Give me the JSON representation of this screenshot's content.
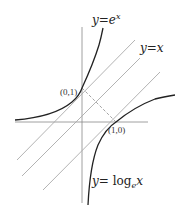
{
  "diagram": {
    "labels": {
      "exp_curve": {
        "prefix": "y",
        "eq": "=",
        "base": "e",
        "sup": "x"
      },
      "identity_line": {
        "prefix": "y",
        "eq": "=",
        "var": "x"
      },
      "log_curve": {
        "prefix": "y",
        "eq": "= ",
        "fn": "log",
        "sub": "e",
        "var": "x"
      }
    },
    "points": {
      "p01": "(0,1)",
      "p10": "(1,0)"
    },
    "colors": {
      "curve": "#222222",
      "axis": "#888888",
      "diagonal": "#aaaaaa",
      "dashed": "#999999"
    },
    "geometry": {
      "origin_px": [
        82,
        122
      ],
      "unit_px": 34
    }
  }
}
